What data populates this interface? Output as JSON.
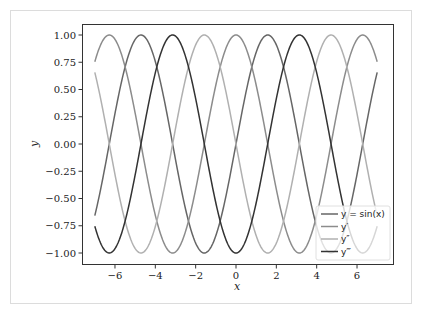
{
  "chart_data": {
    "type": "line",
    "title": "",
    "xlabel": "x",
    "ylabel": "y",
    "xlim": [
      -7,
      7
    ],
    "ylim": [
      -1.1,
      1.1
    ],
    "grid": false,
    "legend_position": "lower right",
    "x_ticks": [
      -6,
      -4,
      -2,
      0,
      2,
      4,
      6
    ],
    "x_tick_labels": [
      "−6",
      "−4",
      "−2",
      "0",
      "2",
      "4",
      "6"
    ],
    "y_ticks": [
      1.0,
      0.75,
      0.5,
      0.25,
      0.0,
      -0.25,
      -0.5,
      -0.75,
      -1.0
    ],
    "y_tick_labels": [
      "1.00",
      "0.75",
      "0.50",
      "0.25",
      "0.00",
      "−0.25",
      "−0.50",
      "−0.75",
      "−1.00"
    ],
    "x_sample_range": [
      -7,
      7
    ],
    "series": [
      {
        "name": "y = sin(x)",
        "function": "sin",
        "color": "#666666",
        "start_value": -0.657,
        "end_value": 0.657
      },
      {
        "name": "y′",
        "function": "cos",
        "color": "#8c8c8c",
        "start_value": 0.754,
        "end_value": 0.754
      },
      {
        "name": "y″",
        "function": "-sin",
        "color": "#b0b0b0",
        "start_value": 0.657,
        "end_value": -0.657
      },
      {
        "name": "y‴",
        "function": "-cos",
        "color": "#333333",
        "start_value": -0.754,
        "end_value": -0.754
      }
    ]
  },
  "legend": {
    "items": [
      {
        "label": "y = sin(x)",
        "color": "#666666"
      },
      {
        "label": "y′",
        "color": "#8c8c8c"
      },
      {
        "label": "y″",
        "color": "#b0b0b0"
      },
      {
        "label": "y‴",
        "color": "#333333"
      }
    ]
  }
}
